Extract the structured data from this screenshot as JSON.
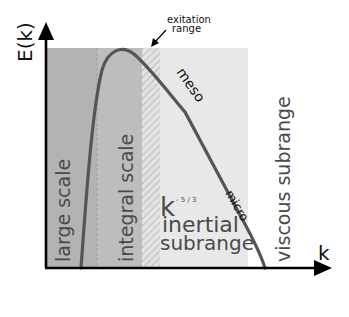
{
  "figure": {
    "y_axis_label": "E(k)",
    "x_axis_label": "k",
    "annotation": {
      "line1": "exitation",
      "line2": "range"
    },
    "regions": [
      {
        "id": "large-scale",
        "label": "large scale",
        "color": "#b3b3b3"
      },
      {
        "id": "integral-scale",
        "label": "integral scale",
        "color": "#bdbdbd"
      },
      {
        "id": "excitation-range",
        "label": "exitation range",
        "color": "hatched"
      },
      {
        "id": "inertial-subrange",
        "label_line1": "inertial",
        "label_line2": "subrange",
        "color": "#e6e6e6"
      },
      {
        "id": "viscous-subrange",
        "label": "viscous subrange",
        "color": "#ffffff"
      }
    ],
    "curve_labels": {
      "meso": "meso",
      "micro": "micro"
    },
    "power_law": {
      "base": "k",
      "exponent": "- 5 / 3"
    },
    "curve_color": "#555555"
  }
}
